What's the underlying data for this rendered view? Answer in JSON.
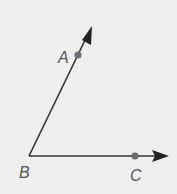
{
  "diagram": {
    "type": "angle",
    "vertex": {
      "label": "B"
    },
    "rays": [
      {
        "from": "B",
        "through": "A",
        "label": "A"
      },
      {
        "from": "B",
        "through": "C",
        "label": "C"
      }
    ],
    "labels": {
      "a": "A",
      "b": "B",
      "c": "C"
    },
    "colors": {
      "line": "#333333",
      "point": "#6e6e6e",
      "label": "#555555",
      "background": "#efefef"
    }
  }
}
